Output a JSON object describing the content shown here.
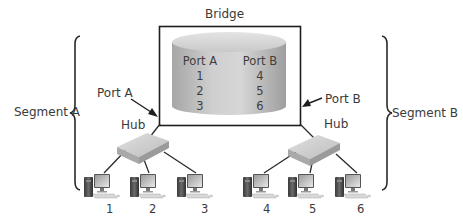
{
  "bridge": {
    "title": "Bridge",
    "table": {
      "headers": [
        "Port A",
        "Port B"
      ],
      "rows": [
        [
          "1",
          "4"
        ],
        [
          "2",
          "5"
        ],
        [
          "3",
          "6"
        ]
      ]
    }
  },
  "segments": {
    "left": {
      "label": "Segment A",
      "port_label": "Port A",
      "hub_label": "Hub",
      "computers": [
        "1",
        "2",
        "3"
      ]
    },
    "right": {
      "label": "Segment B",
      "port_label": "Port B",
      "hub_label": "Hub",
      "computers": [
        "4",
        "5",
        "6"
      ]
    }
  },
  "colors": {
    "line": "#2a2a2a",
    "box_border": "#1e1e1e",
    "cylinder_light": "#dcdcdc",
    "cylinder_dark": "#a8a8a8",
    "hub_fill": "#c8c8c8"
  }
}
